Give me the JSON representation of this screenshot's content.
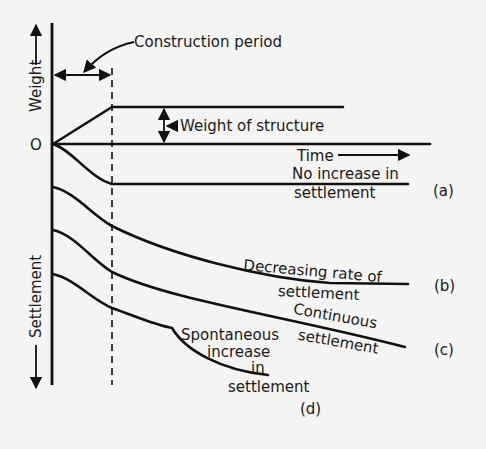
{
  "figure": {
    "axes": {
      "y_up_label": "Weight",
      "y_down_label": "Settlement",
      "origin_label": "O",
      "x_label": "Time"
    },
    "annotations": {
      "construction_period": "Construction period",
      "weight_of_structure": "Weight of structure"
    },
    "curves": {
      "a": {
        "tag": "(a)",
        "line1": "No increase in",
        "line2": "settlement"
      },
      "b": {
        "tag": "(b)",
        "line1": "Decreasing rate of",
        "line2": "settlement"
      },
      "c": {
        "tag": "(c)",
        "line1": "Continuous",
        "line2": "settlement"
      },
      "d": {
        "tag": "(d)",
        "line1": "Spontaneous",
        "line2": "increase",
        "line3": "in",
        "line4": "settlement"
      }
    },
    "colors": {
      "ink": "#111111",
      "paper": "#f4f4f2"
    }
  }
}
